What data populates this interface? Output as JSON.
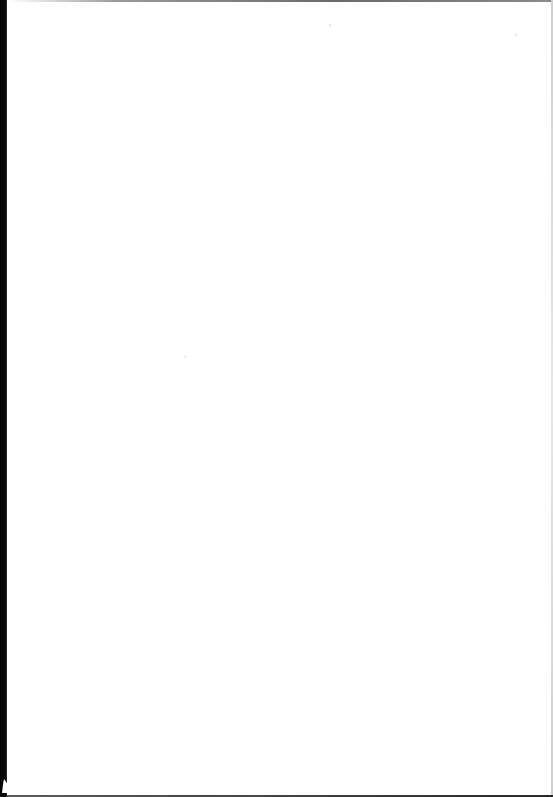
{
  "page": {
    "type": "blank scanned page",
    "content": "",
    "colors": {
      "background": "#ffffff",
      "binding_edge": "#0a0a0a",
      "top_edge": "#7a7a7a"
    }
  }
}
